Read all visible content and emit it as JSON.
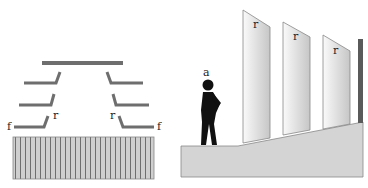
{
  "diagram": {
    "left_panel": {
      "description": "Plan view of fins above a vertically striped wall",
      "labels": {
        "f_left": "f",
        "r_left": "r",
        "r_right": "r",
        "f_right": "f"
      }
    },
    "right_panel": {
      "description": "Elevation view of a person beside tilted fins on a sloped base",
      "labels": {
        "person": "a",
        "fin1": "r",
        "fin2": "r",
        "fin3": "r"
      }
    },
    "colors": {
      "bar": "#6e6e6e",
      "wall_fill": "#cfcfcf",
      "stripe": "#555555",
      "base_fill": "#d4d4d4",
      "fin_light": "#f4f4f4",
      "fin_dark": "#c8c8c8",
      "post": "#5a5a5a",
      "person": "#111111"
    }
  }
}
